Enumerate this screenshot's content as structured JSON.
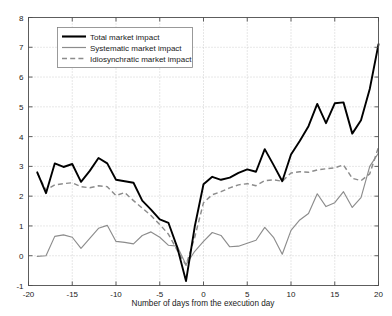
{
  "chart_data": {
    "type": "line",
    "title": "",
    "xlabel": "Number of days from the execution day",
    "ylabel": "",
    "xlim": [
      -20,
      20
    ],
    "ylim": [
      -1,
      8
    ],
    "xticks": [
      -20,
      -15,
      -10,
      -5,
      0,
      5,
      10,
      15,
      20
    ],
    "yticks": [
      -1,
      0,
      1,
      2,
      3,
      4,
      5,
      6,
      7,
      8
    ],
    "xtick_labels": [
      "-20",
      "-15",
      "-10",
      "-5",
      "0",
      "5",
      "10",
      "15",
      "20"
    ],
    "ytick_labels": [
      "-1",
      "0",
      "1",
      "2",
      "3",
      "4",
      "5",
      "6",
      "7",
      "8"
    ],
    "grid": true,
    "legend_position": "upper left",
    "x": [
      -19,
      -18,
      -17,
      -16,
      -15,
      -14,
      -13,
      -12,
      -11,
      -10,
      -9,
      -8,
      -7,
      -6,
      -5,
      -4,
      -3,
      -2,
      -1,
      0,
      1,
      2,
      3,
      4,
      5,
      6,
      7,
      8,
      9,
      10,
      11,
      12,
      13,
      14,
      15,
      16,
      17,
      18,
      19,
      20
    ],
    "series": [
      {
        "name": "Total market impact",
        "color": "#000000",
        "style": "solid",
        "width": "thick",
        "values": [
          2.8,
          2.1,
          3.1,
          2.98,
          3.08,
          2.48,
          2.85,
          3.28,
          3.1,
          2.55,
          2.5,
          2.45,
          1.85,
          1.55,
          1.22,
          1.1,
          0.28,
          -0.85,
          0.98,
          2.4,
          2.65,
          2.55,
          2.62,
          2.78,
          2.9,
          2.82,
          3.58,
          3.05,
          2.5,
          3.4,
          3.85,
          4.35,
          5.1,
          4.45,
          5.12,
          5.15,
          4.1,
          4.55,
          5.6,
          7.1
        ]
      },
      {
        "name": "Systematic market impact",
        "color": "#8c8c8c",
        "style": "solid",
        "width": "thin",
        "values": [
          -0.02,
          0.0,
          0.65,
          0.7,
          0.62,
          0.25,
          0.58,
          0.92,
          1.02,
          0.48,
          0.45,
          0.4,
          0.68,
          0.8,
          0.62,
          0.35,
          0.32,
          -0.3,
          0.15,
          0.48,
          0.78,
          0.68,
          0.3,
          0.32,
          0.42,
          0.52,
          0.95,
          0.62,
          0.05,
          0.85,
          1.2,
          1.42,
          2.08,
          1.65,
          1.78,
          2.15,
          1.62,
          1.95,
          3.0,
          3.45
        ]
      },
      {
        "name": "Idiosynchratic market impact",
        "color": "#8c8c8c",
        "style": "dashed",
        "width": "medium",
        "values": [
          2.78,
          2.2,
          2.38,
          2.42,
          2.45,
          2.32,
          2.28,
          2.35,
          2.32,
          2.02,
          2.12,
          1.85,
          1.6,
          1.35,
          1.05,
          0.72,
          0.18,
          -0.32,
          0.62,
          1.78,
          2.05,
          2.15,
          2.28,
          2.38,
          2.42,
          2.35,
          2.52,
          2.55,
          2.5,
          2.78,
          2.82,
          2.8,
          2.88,
          2.92,
          2.95,
          3.05,
          2.6,
          2.52,
          2.75,
          3.65
        ]
      }
    ]
  },
  "legend": {
    "entries": [
      {
        "label": "Total market impact",
        "marker": "solid-thick-black"
      },
      {
        "label": "Systematic market impact",
        "marker": "solid-thin-gray"
      },
      {
        "label": "Idiosynchratic market impact",
        "marker": "dashed-gray"
      }
    ]
  },
  "axes": {
    "x_axis_title": "Number of days from the execution day"
  }
}
